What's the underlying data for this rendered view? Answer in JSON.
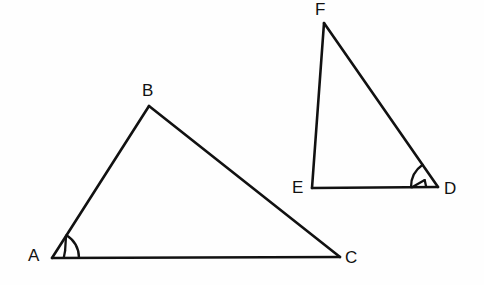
{
  "figure": {
    "background_color": "#fefefe",
    "stroke_color": "#111111",
    "width": 484,
    "height": 285
  },
  "chart_data": {
    "type": "diagram",
    "subtype": "geometry-triangles",
    "xlabel": "",
    "ylabel": "",
    "grid": false,
    "legend": "none",
    "coordinate_system": "screen pixels, origin top-left",
    "xlim": [
      0,
      484
    ],
    "ylim": [
      0,
      285
    ],
    "shapes": [
      {
        "name": "triangle-abc",
        "kind": "triangle",
        "vertices": [
          {
            "label": "A",
            "x": 52,
            "y": 258
          },
          {
            "label": "B",
            "x": 149,
            "y": 106
          },
          {
            "label": "C",
            "x": 340,
            "y": 257
          }
        ],
        "edges": [
          {
            "from": "A",
            "to": "B"
          },
          {
            "from": "B",
            "to": "C"
          },
          {
            "from": "C",
            "to": "A"
          }
        ],
        "marked_angle": "A"
      },
      {
        "name": "triangle-def",
        "kind": "triangle",
        "vertices": [
          {
            "label": "F",
            "x": 324,
            "y": 23
          },
          {
            "label": "E",
            "x": 312,
            "y": 188
          },
          {
            "label": "D",
            "x": 438,
            "y": 187
          }
        ],
        "edges": [
          {
            "from": "F",
            "to": "E"
          },
          {
            "from": "E",
            "to": "D"
          },
          {
            "from": "D",
            "to": "F"
          }
        ],
        "marked_angle": "D"
      }
    ],
    "angle_marks": [
      {
        "at_vertex": "A",
        "style": "arc-with-tick",
        "shape": "triangle-abc"
      },
      {
        "at_vertex": "D",
        "style": "arc-with-tick",
        "shape": "triangle-def"
      }
    ]
  },
  "labels": {
    "a": "A",
    "b": "B",
    "c": "C",
    "d": "D",
    "e": "E",
    "f": "F"
  }
}
